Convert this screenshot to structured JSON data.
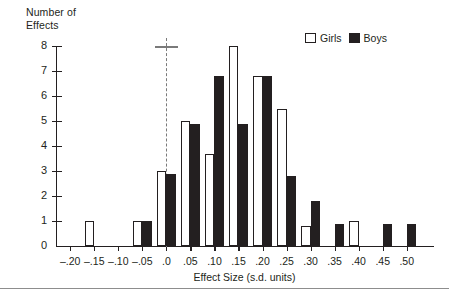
{
  "axes": {
    "ylabel": "Number of\nEffects",
    "xlabel": "Effect Size (s.d. units)",
    "yticks": [
      "0",
      "1",
      "2",
      "3",
      "4",
      "5",
      "6",
      "7",
      "8"
    ],
    "xticks": [
      "–.20",
      "–.15",
      "–.10",
      "–.05",
      ".0",
      ".05",
      ".10",
      ".15",
      ".20",
      ".25",
      ".30",
      ".35",
      ".40",
      ".45",
      ".50"
    ]
  },
  "legend": {
    "girls_label": "Girls",
    "boys_label": "Boys",
    "girls_color": "#ffffff",
    "boys_color": "#231f20"
  },
  "annotation": {
    "reference_line_at": ".0",
    "reference_line_style": "dashed",
    "reference_line_color": "#7a7a7a",
    "cap_at_y": 8
  },
  "chart_data": {
    "type": "bar",
    "title": "",
    "xlabel": "Effect Size (s.d. units)",
    "ylabel": "Number of Effects",
    "ylim": [
      0,
      8
    ],
    "grid": false,
    "legend_position": "top-right",
    "categories": [
      "-.20",
      "-.15",
      "-.10",
      "-.05",
      ".0",
      ".05",
      ".10",
      ".15",
      ".20",
      ".25",
      ".30",
      ".35",
      ".40",
      ".45",
      ".50"
    ],
    "series": [
      {
        "name": "Girls",
        "color": "#ffffff",
        "values": [
          0,
          1,
          0,
          1,
          3,
          5,
          3.7,
          8,
          6.8,
          5.5,
          0.8,
          0,
          1,
          0,
          0
        ]
      },
      {
        "name": "Boys",
        "color": "#231f20",
        "values": [
          0,
          0,
          0,
          1,
          2.9,
          4.9,
          6.8,
          4.9,
          6.8,
          2.8,
          1.8,
          0.9,
          0,
          0.9,
          0.9
        ]
      }
    ],
    "annotations": [
      {
        "type": "vline",
        "x": ".0",
        "style": "dashed",
        "color": "#7a7a7a",
        "cap_y": 8
      }
    ]
  }
}
